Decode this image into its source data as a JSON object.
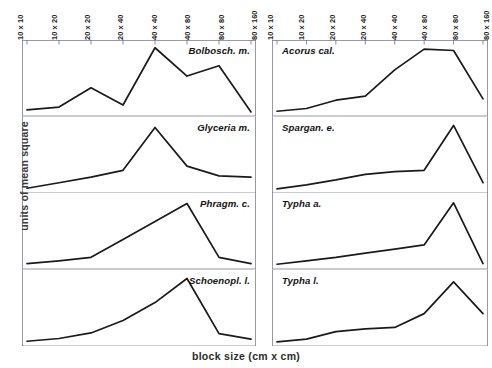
{
  "figure": {
    "xlabel": "block size (cm x cm)",
    "ylabel": "units of mean square",
    "axis_color": "#4a4a6a",
    "line_color": "#1a1a1a"
  },
  "chart_data": {
    "type": "line",
    "title": "",
    "xlabel": "block size (cm x cm)",
    "ylabel": "units of mean square",
    "grid": false,
    "legend": "none",
    "layout": "small-multiples 2 columns x 4 rows",
    "categories": [
      "10 x 10",
      "10 x 20",
      "20 x 20",
      "20 x 40",
      "40 x 40",
      "40 x 80",
      "80 x 80",
      "80 x 160"
    ],
    "ylim": [
      0,
      100
    ],
    "yticks_shown": false,
    "series": [
      {
        "name": "Bolbosch. m.",
        "column": "left",
        "row": 1,
        "values": [
          6,
          10,
          38,
          13,
          96,
          55,
          70,
          3
        ]
      },
      {
        "name": "Glyceria m.",
        "column": "left",
        "row": 2,
        "values": [
          4,
          12,
          20,
          30,
          92,
          36,
          22,
          20
        ]
      },
      {
        "name": "Phragm. c.",
        "column": "left",
        "row": 3,
        "values": [
          5,
          9,
          14,
          40,
          66,
          92,
          14,
          5
        ]
      },
      {
        "name": "Schoenopl. l.",
        "column": "left",
        "row": 4,
        "values": [
          4,
          8,
          16,
          34,
          60,
          95,
          15,
          7
        ]
      },
      {
        "name": "Acorus cal.",
        "column": "right",
        "row": 1,
        "values": [
          4,
          8,
          20,
          26,
          64,
          94,
          92,
          22
        ]
      },
      {
        "name": "Spargan. e.",
        "column": "right",
        "row": 2,
        "values": [
          3,
          9,
          16,
          24,
          28,
          30,
          95,
          12
        ]
      },
      {
        "name": "Typha a.",
        "column": "right",
        "row": 3,
        "values": [
          4,
          9,
          14,
          20,
          26,
          32,
          93,
          5
        ]
      },
      {
        "name": "Typha l.",
        "column": "right",
        "row": 4,
        "values": [
          3,
          7,
          18,
          22,
          24,
          44,
          90,
          44
        ]
      }
    ]
  },
  "columns": [
    {
      "id": "left",
      "label_align": "right",
      "ticks": [
        "10 x 10",
        "10 x 20",
        "20 x 20",
        "20 x 40",
        "40 x 40",
        "40 x 80",
        "80 x 80",
        "80 x 160"
      ],
      "panels": [
        {
          "species": "Bolbosch. m."
        },
        {
          "species": "Glyceria m."
        },
        {
          "species": "Phragm. c."
        },
        {
          "species": "Schoenopl. l."
        }
      ]
    },
    {
      "id": "right",
      "label_align": "left",
      "ticks": [
        "10 x 10",
        "10 x 20",
        "20 x 20",
        "20 x 40",
        "40 x 40",
        "40 x 80",
        "80 x 80",
        "80 x 160"
      ],
      "panels": [
        {
          "species": "Acorus cal."
        },
        {
          "species": "Spargan. e."
        },
        {
          "species": "Typha a."
        },
        {
          "species": "Typha l."
        }
      ]
    }
  ]
}
